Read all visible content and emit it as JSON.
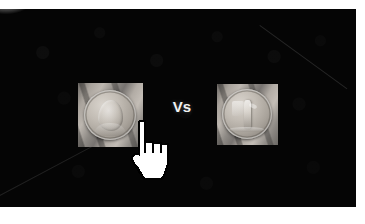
{
  "scene": {
    "type": "comparison-slide",
    "background_color": "#050505",
    "page_background": "#ffffff",
    "stage": {
      "left": 0,
      "top": 9,
      "width": 356,
      "height": 198
    }
  },
  "comparison": {
    "separator_label": "Vs",
    "separator_color": "#f2f2f2",
    "items": [
      {
        "position": "left",
        "alt": "photograph of a hand holding a worn silver coin showing a portrait bust",
        "subject": "coin-obverse-portrait",
        "frame_color": "#8d8d8d"
      },
      {
        "position": "right",
        "alt": "photograph of a hand holding a silver coin showing a standing figure",
        "subject": "coin-reverse-standing-figure",
        "frame_color": "#8d8d8d"
      }
    ]
  },
  "cursor": {
    "kind": "pointing-hand",
    "fill_color": "#ffffff",
    "outline_color": "#000000",
    "x": 129,
    "y": 110
  }
}
